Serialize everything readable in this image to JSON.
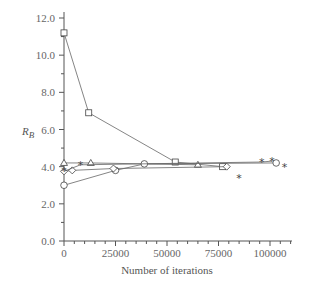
{
  "chart_data": {
    "type": "line",
    "title": "",
    "xlabel": "Number of iterations",
    "ylabel": "R_B",
    "ylabel_main": "R",
    "ylabel_sub": "B",
    "xlim": [
      0,
      110000
    ],
    "ylim": [
      0,
      12.5
    ],
    "x_ticks": [
      0,
      25000,
      50000,
      75000,
      100000
    ],
    "x_tick_labels": [
      "0",
      "25000",
      "50000",
      "75000",
      "100000"
    ],
    "y_ticks": [
      0,
      2,
      4,
      6,
      8,
      10,
      12
    ],
    "y_tick_labels": [
      "0.0",
      "2.0",
      "4.0",
      "6.0",
      "8.0",
      "10.0",
      "12.0"
    ],
    "grid": false,
    "legend": null,
    "series": [
      {
        "name": "square",
        "marker": "square",
        "x": [
          0,
          12000,
          54000,
          77000
        ],
        "y": [
          11.2,
          6.9,
          4.25,
          4.0
        ]
      },
      {
        "name": "triangle",
        "marker": "triangle",
        "x": [
          0,
          13000,
          65000
        ],
        "y": [
          4.2,
          4.2,
          4.1
        ]
      },
      {
        "name": "circle",
        "marker": "circle",
        "x": [
          0,
          25000,
          39000,
          103000
        ],
        "y": [
          3.0,
          3.8,
          4.15,
          4.2
        ]
      },
      {
        "name": "diamond",
        "marker": "diamond",
        "x": [
          0,
          4000,
          24000,
          79000
        ],
        "y": [
          3.75,
          3.8,
          3.9,
          4.0
        ]
      },
      {
        "name": "star",
        "marker": "star",
        "x": [
          0,
          8000,
          96000,
          101000
        ],
        "y": [
          3.75,
          4.1,
          4.25,
          4.3
        ]
      },
      {
        "name": "star-isolated",
        "marker": "star",
        "line": false,
        "x": [
          85000,
          107000
        ],
        "y": [
          3.4,
          4.0
        ]
      }
    ]
  },
  "axes": {
    "xlabel": "Number of iterations",
    "ylabel_main": "R",
    "ylabel_sub": "B"
  }
}
